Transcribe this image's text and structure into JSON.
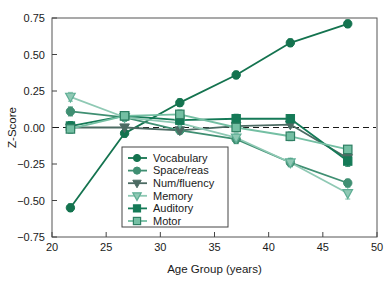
{
  "chart_data": {
    "type": "line",
    "title": "",
    "subtitle": "",
    "xlabel": "Age Group (years)",
    "ylabel": "Z-Score",
    "xlim": [
      20,
      50
    ],
    "ylim": [
      -0.75,
      0.75
    ],
    "xticks": [
      20,
      25,
      30,
      35,
      40,
      45,
      50
    ],
    "xtick_labels": [
      "20",
      "25",
      "30",
      "35",
      "40",
      "45",
      "50"
    ],
    "yticks": [
      -0.75,
      -0.5,
      -0.25,
      0.0,
      0.25,
      0.5,
      0.75
    ],
    "ytick_labels": [
      "-0.75",
      "-0.50",
      "-0.25",
      "0.00",
      "0.25",
      "0.50",
      "0.75"
    ],
    "grid": false,
    "reference_line": {
      "y": 0.0,
      "style": "dashed",
      "color": "#1a1a1a"
    },
    "legend_position": "lower-center-left",
    "error_bars": true,
    "x": [
      21.7,
      26.7,
      31.8,
      37.0,
      42.0,
      47.3
    ],
    "series": [
      {
        "name": "Vocabulary",
        "marker": "circle",
        "color": "#14734f",
        "values": [
          -0.55,
          -0.04,
          0.17,
          0.36,
          0.58,
          0.71
        ],
        "errors": [
          0.025,
          0.025,
          0.025,
          0.025,
          0.025,
          0.025
        ]
      },
      {
        "name": "Space/reas",
        "marker": "circle",
        "color": "#3f8f72",
        "values": [
          0.11,
          0.07,
          -0.02,
          -0.08,
          -0.24,
          -0.38
        ],
        "errors": [
          0.03,
          0.025,
          0.025,
          0.03,
          0.025,
          0.025
        ]
      },
      {
        "name": "Num/fluency",
        "marker": "triangle-down",
        "color": "#4c6b63",
        "values": [
          0.0,
          0.0,
          -0.02,
          0.01,
          0.02,
          -0.21
        ],
        "errors": [
          0.025,
          0.02,
          0.02,
          0.02,
          0.02,
          0.025
        ]
      },
      {
        "name": "Memory",
        "marker": "triangle-down-open",
        "color": "#8fc9b4",
        "values": [
          0.21,
          0.07,
          0.03,
          -0.07,
          -0.24,
          -0.45
        ],
        "errors": [
          0.03,
          0.025,
          0.03,
          0.03,
          0.03,
          0.04
        ]
      },
      {
        "name": "Auditory",
        "marker": "square",
        "color": "#157a57",
        "values": [
          0.01,
          0.08,
          0.05,
          0.06,
          0.06,
          -0.23
        ],
        "errors": [
          0.03,
          0.02,
          0.03,
          0.03,
          0.025,
          0.035
        ]
      },
      {
        "name": "Motor",
        "marker": "square-open",
        "color": "#74bfa3",
        "values": [
          -0.01,
          0.08,
          0.09,
          0.0,
          -0.06,
          -0.15
        ],
        "errors": [
          0.03,
          0.02,
          0.03,
          0.03,
          0.03,
          0.025
        ]
      }
    ]
  }
}
